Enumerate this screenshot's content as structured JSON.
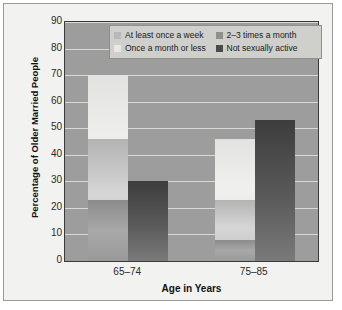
{
  "chart_data": {
    "type": "bar",
    "title": "",
    "xlabel": "Age in Years",
    "ylabel": "Percentage of Older Married People",
    "categories": [
      "65–74",
      "75–85"
    ],
    "ylim": [
      0,
      90
    ],
    "yticks": [
      0,
      10,
      20,
      30,
      40,
      50,
      60,
      70,
      80,
      90
    ],
    "grid": true,
    "legend_position": "top-right",
    "series": [
      {
        "name": "At least once a week",
        "values": [
          46,
          23
        ],
        "color": "#b8b8b8"
      },
      {
        "name": "2–3 times a month",
        "values": [
          23,
          8
        ],
        "color": "#8f8f8f"
      },
      {
        "name": "Once a month or less",
        "values": [
          70,
          46
        ],
        "color": "#e8e8e6"
      },
      {
        "name": "Not sexually active",
        "values": [
          30,
          53
        ],
        "color": "#4a4a4a"
      }
    ]
  },
  "legend": {
    "items": [
      {
        "label": "At least once a week"
      },
      {
        "label": "2–3 times a month"
      },
      {
        "label": "Once a month or less"
      },
      {
        "label": "Not sexually active"
      }
    ]
  },
  "axes": {
    "y_title": "Percentage of Older Married People",
    "x_title": "Age in Years",
    "y_ticks": [
      "90",
      "80",
      "70",
      "60",
      "50",
      "40",
      "30",
      "20",
      "10",
      "0"
    ],
    "x_ticks": [
      "65–74",
      "75–85"
    ]
  }
}
